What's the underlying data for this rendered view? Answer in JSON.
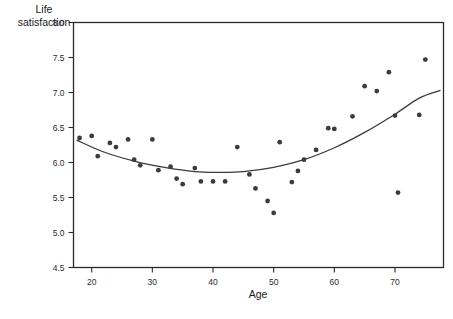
{
  "chart_data": {
    "type": "scatter",
    "title": "",
    "xlabel": "Age",
    "ylabel": "Life satisfaction",
    "ylabel_line1": "Life",
    "ylabel_line2": "satisfaction",
    "xlim": [
      17,
      78
    ],
    "ylim": [
      4.5,
      8.0
    ],
    "xticks": [
      20,
      30,
      40,
      50,
      60,
      70
    ],
    "yticks": [
      "8.0",
      "7.5",
      "7.0",
      "6.5",
      "6.0",
      "5.5",
      "5.0",
      "4.5"
    ],
    "ytick_values": [
      8.0,
      7.5,
      7.0,
      6.5,
      6.0,
      5.5,
      5.0,
      4.5
    ],
    "grid": false,
    "legend": false,
    "point_color": "#3c3c3c",
    "line_color": "#3a3a3a",
    "frame_color": "#2a2a2a",
    "points": [
      {
        "x": 18,
        "y": 6.35
      },
      {
        "x": 20,
        "y": 6.38
      },
      {
        "x": 21,
        "y": 6.09
      },
      {
        "x": 23,
        "y": 6.28
      },
      {
        "x": 24,
        "y": 6.22
      },
      {
        "x": 26,
        "y": 6.33
      },
      {
        "x": 27,
        "y": 6.04
      },
      {
        "x": 28,
        "y": 5.96
      },
      {
        "x": 30,
        "y": 6.33
      },
      {
        "x": 31,
        "y": 5.89
      },
      {
        "x": 33,
        "y": 5.94
      },
      {
        "x": 34,
        "y": 5.77
      },
      {
        "x": 35,
        "y": 5.69
      },
      {
        "x": 37,
        "y": 5.92
      },
      {
        "x": 38,
        "y": 5.73
      },
      {
        "x": 40,
        "y": 5.73
      },
      {
        "x": 42,
        "y": 5.73
      },
      {
        "x": 44,
        "y": 6.22
      },
      {
        "x": 46,
        "y": 5.83
      },
      {
        "x": 47,
        "y": 5.63
      },
      {
        "x": 49,
        "y": 5.45
      },
      {
        "x": 51,
        "y": 6.29
      },
      {
        "x": 50,
        "y": 5.28
      },
      {
        "x": 53,
        "y": 5.72
      },
      {
        "x": 54,
        "y": 5.88
      },
      {
        "x": 55,
        "y": 6.04
      },
      {
        "x": 57,
        "y": 6.18
      },
      {
        "x": 59,
        "y": 6.49
      },
      {
        "x": 60,
        "y": 6.48
      },
      {
        "x": 63,
        "y": 6.66
      },
      {
        "x": 65,
        "y": 7.09
      },
      {
        "x": 67,
        "y": 7.02
      },
      {
        "x": 69,
        "y": 7.29
      },
      {
        "x": 70,
        "y": 6.67
      },
      {
        "x": 70.5,
        "y": 5.57
      },
      {
        "x": 74,
        "y": 6.68
      },
      {
        "x": 75,
        "y": 7.47
      }
    ],
    "fit_curve": [
      {
        "x": 17.5,
        "y": 6.32
      },
      {
        "x": 22,
        "y": 6.15
      },
      {
        "x": 27,
        "y": 6.02
      },
      {
        "x": 32,
        "y": 5.93
      },
      {
        "x": 37,
        "y": 5.87
      },
      {
        "x": 41,
        "y": 5.86
      },
      {
        "x": 45,
        "y": 5.87
      },
      {
        "x": 50,
        "y": 5.93
      },
      {
        "x": 55,
        "y": 6.04
      },
      {
        "x": 60,
        "y": 6.21
      },
      {
        "x": 65,
        "y": 6.43
      },
      {
        "x": 70,
        "y": 6.69
      },
      {
        "x": 74,
        "y": 6.92
      },
      {
        "x": 77.5,
        "y": 7.03
      }
    ]
  }
}
